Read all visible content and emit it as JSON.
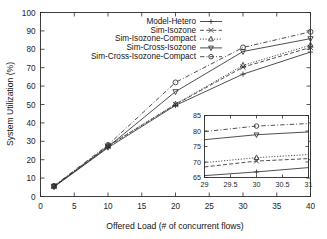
{
  "chart_data": {
    "type": "line",
    "title": "",
    "xlabel": "Offered Load (# of concurrent flows)",
    "ylabel": "System Utilization (%)",
    "xlim": [
      0,
      40
    ],
    "ylim": [
      0,
      100
    ],
    "xticks": [
      0,
      5,
      10,
      15,
      20,
      25,
      30,
      35,
      40
    ],
    "yticks": [
      0,
      10,
      20,
      30,
      40,
      50,
      60,
      70,
      80,
      90,
      100
    ],
    "grid": false,
    "legend_position": "top-center",
    "x": [
      2,
      10,
      20,
      30,
      40
    ],
    "series": [
      {
        "name": "Model-Hetero",
        "marker": "plus",
        "dash": "solid",
        "values": [
          5.2,
          26.5,
          49.5,
          66.5,
          78.5
        ]
      },
      {
        "name": "Sim-Isozone",
        "marker": "cross",
        "dash": "dashed",
        "values": [
          5.5,
          27.3,
          50.0,
          70.3,
          81.0
        ]
      },
      {
        "name": "Sim-Isozone-Compact",
        "marker": "triangle-up",
        "dash": "dotted",
        "values": [
          5.6,
          27.6,
          50.2,
          71.3,
          82.2
        ]
      },
      {
        "name": "Sim-Cross-Isozone",
        "marker": "triangle-down",
        "dash": "solid",
        "values": [
          5.4,
          27.0,
          57.0,
          78.8,
          85.8
        ]
      },
      {
        "name": "Sim-Cross-Isozone-Compact",
        "marker": "circle",
        "dash": "dash-dot",
        "values": [
          5.8,
          28.0,
          62.0,
          81.0,
          89.5
        ]
      }
    ],
    "inset": {
      "xlim": [
        29,
        31
      ],
      "ylim": [
        65,
        85
      ],
      "xticks": [
        29,
        29.5,
        30,
        30.5,
        31
      ],
      "yticks": [
        65,
        70,
        75,
        80,
        85
      ],
      "xtick_labels": [
        "29",
        "29.5",
        "30",
        "30.5",
        "31"
      ],
      "ytick_labels": [
        "65",
        "70",
        "75",
        "80",
        "85"
      ],
      "x": [
        29,
        30,
        31
      ],
      "series": [
        {
          "name": "Model-Hetero",
          "marker": "plus",
          "dash": "solid",
          "values": [
            65.6,
            66.8,
            68.2
          ]
        },
        {
          "name": "Sim-Isozone",
          "marker": "cross",
          "dash": "dashed",
          "values": [
            68.4,
            70.3,
            71.1
          ]
        },
        {
          "name": "Sim-Isozone-Compact",
          "marker": "triangle-up",
          "dash": "dotted",
          "values": [
            69.8,
            71.4,
            72.4
          ]
        },
        {
          "name": "Sim-Cross-Isozone",
          "marker": "triangle-down",
          "dash": "solid",
          "values": [
            77.2,
            78.8,
            79.7
          ]
        },
        {
          "name": "Sim-Cross-Isozone-Compact",
          "marker": "circle",
          "dash": "dash-dot",
          "values": [
            79.8,
            81.6,
            82.4
          ]
        }
      ]
    }
  }
}
